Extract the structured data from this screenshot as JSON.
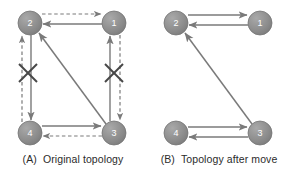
{
  "figure": {
    "background_color": "#ffffff",
    "node_fill": "#8d8d8d",
    "node_fill_light": "#a8a8a8",
    "node_stroke": "#6f6f6f",
    "edge_color": "#7a7a7a",
    "x_mark_color": "#444444",
    "label_color": "#ffffff",
    "caption_color": "#2b2b2b"
  },
  "panels": [
    {
      "id": "a",
      "caption_tag": "(A)",
      "caption_text": "Original topology",
      "nodes": [
        {
          "id": "n2",
          "label": "2",
          "cx": 30,
          "cy": 23,
          "r": 12
        },
        {
          "id": "n1",
          "label": "1",
          "cx": 114,
          "cy": 23,
          "r": 12
        },
        {
          "id": "n4",
          "label": "4",
          "cx": 30,
          "cy": 133,
          "r": 12
        },
        {
          "id": "n3",
          "label": "3",
          "cx": 114,
          "cy": 133,
          "r": 12
        }
      ],
      "edges": [
        {
          "id": "e-2-1-dashed",
          "from": "2",
          "to": "1",
          "style": "dashed",
          "direction": "right"
        },
        {
          "id": "e-1-2-solid",
          "from": "1",
          "to": "2",
          "style": "solid",
          "direction": "left"
        },
        {
          "id": "e-4-2-dashed",
          "from": "4",
          "to": "2",
          "style": "dashed",
          "direction": "up"
        },
        {
          "id": "e-2-4-solid",
          "from": "2",
          "to": "4",
          "style": "solid",
          "direction": "down"
        },
        {
          "id": "e-3-1-solid",
          "from": "3",
          "to": "1",
          "style": "solid",
          "direction": "up"
        },
        {
          "id": "e-1-3-dashed",
          "from": "1",
          "to": "3",
          "style": "dashed",
          "direction": "down"
        },
        {
          "id": "e-4-3-solid",
          "from": "4",
          "to": "3",
          "style": "solid",
          "direction": "right"
        },
        {
          "id": "e-3-4-dashed",
          "from": "3",
          "to": "4",
          "style": "dashed",
          "direction": "left"
        },
        {
          "id": "e-3-2-diagonal",
          "from": "3",
          "to": "2",
          "style": "solid",
          "direction": "up-left"
        }
      ],
      "broken_links": [
        {
          "id": "x-left",
          "cx": 28,
          "cy": 73,
          "size": 9
        },
        {
          "id": "x-right",
          "cx": 114,
          "cy": 73,
          "size": 9
        }
      ]
    },
    {
      "id": "b",
      "caption_tag": "(B)",
      "caption_text": "Topology after move",
      "nodes": [
        {
          "id": "n2",
          "label": "2",
          "cx": 30,
          "cy": 23,
          "r": 12
        },
        {
          "id": "n1",
          "label": "1",
          "cx": 114,
          "cy": 23,
          "r": 12
        },
        {
          "id": "n4",
          "label": "4",
          "cx": 30,
          "cy": 133,
          "r": 12
        },
        {
          "id": "n3",
          "label": "3",
          "cx": 114,
          "cy": 133,
          "r": 12
        }
      ],
      "edges": [
        {
          "id": "e-2-1-solid",
          "from": "2",
          "to": "1",
          "style": "solid",
          "direction": "right"
        },
        {
          "id": "e-1-2-solid",
          "from": "1",
          "to": "2",
          "style": "solid",
          "direction": "left"
        },
        {
          "id": "e-4-3-solid",
          "from": "4",
          "to": "3",
          "style": "solid",
          "direction": "right"
        },
        {
          "id": "e-3-4-solid",
          "from": "3",
          "to": "4",
          "style": "solid",
          "direction": "left"
        },
        {
          "id": "e-3-2-diagonal",
          "from": "3",
          "to": "2",
          "style": "solid",
          "direction": "up-left"
        }
      ],
      "broken_links": []
    }
  ]
}
